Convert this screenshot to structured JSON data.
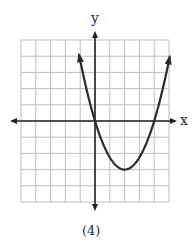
{
  "chart_data": {
    "type": "line",
    "title": "",
    "caption": "(4)",
    "xlabel": "x",
    "ylabel": "y",
    "xlim": [
      -5,
      5
    ],
    "ylim": [
      -5,
      5
    ],
    "grid": true,
    "grid_cells": {
      "x": 10,
      "y": 10
    },
    "legend": null,
    "series": [
      {
        "name": "parabola",
        "equation": "y = 0.75(x - 2)^2 - 3",
        "vertex": [
          2,
          -3
        ],
        "x_intercepts": [
          0,
          4
        ],
        "y_intercept": 0,
        "x": [
          -1.1,
          -1,
          0,
          1,
          2,
          3,
          4,
          5
        ],
        "y": [
          4.2,
          3.75,
          0,
          -2.25,
          -3,
          -2.25,
          0,
          3.75
        ],
        "arrows_at_ends": true
      }
    ]
  },
  "labels": {
    "x_axis": "x",
    "y_axis": "y",
    "caption": "(4)"
  },
  "colors": {
    "grid": "#bdbdbd",
    "axis": "#222222",
    "curve": "#2b2b2b"
  }
}
